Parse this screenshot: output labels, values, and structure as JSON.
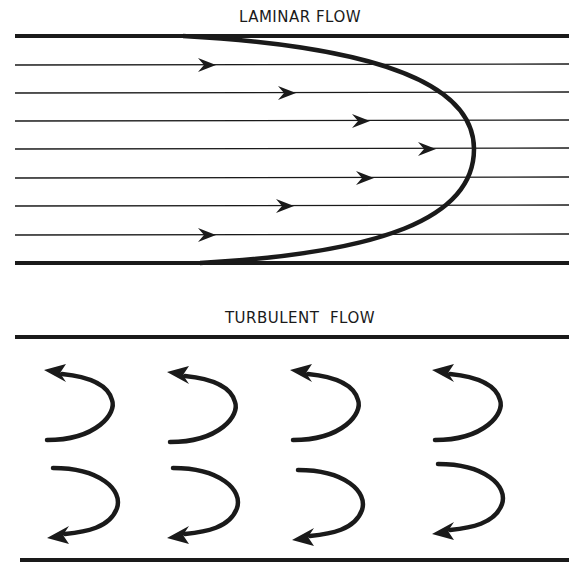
{
  "laminar": {
    "title": "LAMINAR FLOW",
    "title_pos": {
      "x": 300,
      "y": 8
    },
    "walls": {
      "top_y": 36,
      "bottom_y": 263,
      "x_start": 15,
      "x_end": 569
    },
    "streamlines_y": [
      65,
      93,
      121,
      149,
      178,
      206,
      235
    ],
    "arrow_tips_x": [
      216,
      296,
      370,
      436,
      374,
      294,
      216
    ],
    "profile": {
      "top_x": 183,
      "vertex_x": 474,
      "vertex_y": 149,
      "bottom_x": 200
    },
    "icon": "parabolic-velocity-profile"
  },
  "turbulent": {
    "title": "TURBULENT  FLOW",
    "title_pos": {
      "x": 300,
      "y": 309
    },
    "walls": {
      "top_y": 337,
      "bottom_y": 560,
      "x_start": 15,
      "x_end": 569
    },
    "eddies_top": [
      {
        "cx": 72,
        "cy": 408,
        "dir": "ccw"
      },
      {
        "cx": 195,
        "cy": 410,
        "dir": "ccw"
      },
      {
        "cx": 318,
        "cy": 408,
        "dir": "ccw"
      },
      {
        "cx": 460,
        "cy": 408,
        "dir": "ccw"
      }
    ],
    "eddies_bottom": [
      {
        "cx": 75,
        "cy": 500,
        "dir": "cw"
      },
      {
        "cx": 195,
        "cy": 500,
        "dir": "cw"
      },
      {
        "cx": 320,
        "cy": 502,
        "dir": "cw"
      },
      {
        "cx": 460,
        "cy": 496,
        "dir": "cw"
      }
    ],
    "icon": "curved-eddy-arrow"
  },
  "colors": {
    "ink": "#1a1a1a",
    "background": "#ffffff"
  }
}
